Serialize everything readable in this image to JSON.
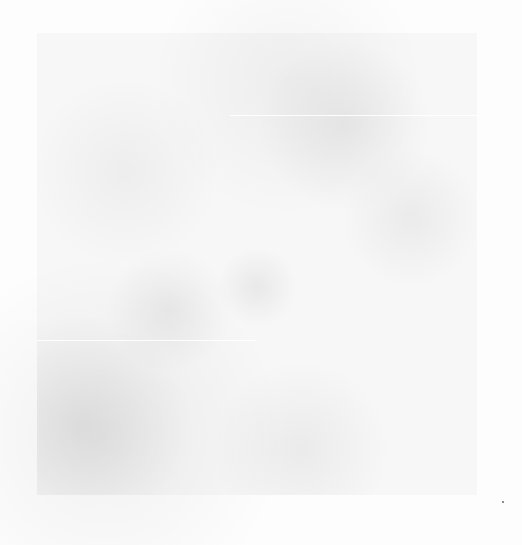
{
  "image": {
    "description": "Near-white noisy grayscale texture with a slightly darker square region; no legible text or UI elements",
    "background_color": "#fdfdfd",
    "texture_color": "#d8d8d8"
  }
}
